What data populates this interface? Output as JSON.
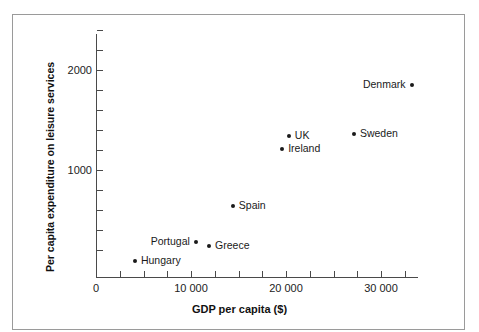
{
  "chart_data": {
    "type": "scatter",
    "title": "",
    "xlabel": "GDP per capita ($)",
    "ylabel": "Per capita expenditure on leisure services",
    "xlim": [
      0,
      33900
    ],
    "ylim": [
      0,
      2440
    ],
    "grid": false,
    "legend": "none",
    "x_ticks_major": [
      {
        "value": 0,
        "label": "0"
      },
      {
        "value": 10000,
        "label": "10 000"
      },
      {
        "value": 20000,
        "label": "20 000"
      },
      {
        "value": 30000,
        "label": "30 000"
      }
    ],
    "x_ticks_minor": [
      2500,
      5000,
      7500,
      12500,
      15000,
      17500,
      22500,
      25000,
      27500,
      32500
    ],
    "y_ticks_major": [
      {
        "value": 1000,
        "label": "1000"
      },
      {
        "value": 2000,
        "label": "2000"
      }
    ],
    "y_ticks_minor": [
      200,
      400,
      600,
      800,
      1200,
      1400,
      1600,
      1800,
      2200,
      2400
    ],
    "points": [
      {
        "label": "Hungary",
        "x": 4100,
        "y": 90,
        "label_side": "right"
      },
      {
        "label": "Portugal",
        "x": 10500,
        "y": 280,
        "label_side": "left"
      },
      {
        "label": "Greece",
        "x": 11900,
        "y": 240,
        "label_side": "right"
      },
      {
        "label": "Spain",
        "x": 14400,
        "y": 640,
        "label_side": "right"
      },
      {
        "label": "Ireland",
        "x": 19600,
        "y": 1210,
        "label_side": "right"
      },
      {
        "label": "UK",
        "x": 20300,
        "y": 1340,
        "label_side": "right"
      },
      {
        "label": "Sweden",
        "x": 27150,
        "y": 1360,
        "label_side": "right"
      },
      {
        "label": "Denmark",
        "x": 33250,
        "y": 1850,
        "label_side": "left"
      }
    ],
    "colors": {
      "marker": "#1a1a1a",
      "axis": "#4a4a4a",
      "text": "#1a1a1a",
      "frame": "#9a9a9a",
      "background": "#ffffff"
    }
  }
}
